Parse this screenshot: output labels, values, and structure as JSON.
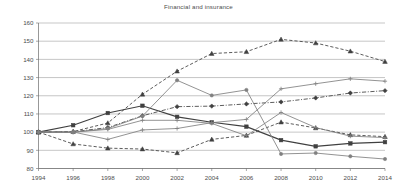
{
  "chart": {
    "title": "Financial and insurance",
    "domain_note": "line chart"
  },
  "axes": {
    "y_ticks": [
      "80",
      "90",
      "100",
      "110",
      "120",
      "130",
      "140",
      "150",
      "160"
    ],
    "x_ticks": [
      "1994",
      "1996",
      "1998",
      "2000",
      "2002",
      "2004",
      "2006",
      "2008",
      "2010",
      "2012",
      "2014"
    ]
  },
  "chart_data": {
    "type": "line",
    "title": "Financial and insurance",
    "xlabel": "",
    "ylabel": "",
    "x": [
      1994,
      1996,
      1998,
      2000,
      2002,
      2004,
      2006,
      2008,
      2010,
      2012,
      2014
    ],
    "xlim": [
      1994,
      2014
    ],
    "ylim": [
      80,
      160
    ],
    "y_ticks": [
      80,
      90,
      100,
      110,
      120,
      130,
      140,
      150,
      160
    ],
    "grid": true,
    "legend": "none",
    "series": [
      {
        "name": "series-1-dashed-triangle",
        "style": "dashed",
        "marker": "triangle",
        "color": "#404040",
        "values": [
          100,
          93.5,
          91.2,
          90.7,
          88.6,
          96.0,
          98.2,
          105.5,
          102.3,
          98.5,
          97.5
        ]
      },
      {
        "name": "series-2-dashed-triangle-high",
        "style": "dashed",
        "marker": "triangle",
        "color": "#404040",
        "values": [
          100,
          100.3,
          105.0,
          120.8,
          133.5,
          143.2,
          144.2,
          151.0,
          149.0,
          144.5,
          138.8
        ]
      },
      {
        "name": "series-3-solid-square",
        "style": "solid",
        "marker": "square",
        "color": "#404040",
        "values": [
          100,
          103.8,
          110.5,
          114.5,
          108.4,
          105.4,
          103.0,
          95.6,
          92.2,
          93.8,
          94.5
        ]
      },
      {
        "name": "series-4-dashdot-diamond",
        "style": "dashdot",
        "marker": "diamond",
        "color": "#404040",
        "values": [
          100,
          100.2,
          102.5,
          109.0,
          114.0,
          114.3,
          115.5,
          116.6,
          118.8,
          121.5,
          122.8
        ]
      },
      {
        "name": "series-5-solid-plus",
        "style": "solid",
        "marker": "plus",
        "color": "#808080",
        "values": [
          100,
          100.1,
          96.0,
          101.2,
          102.0,
          105.2,
          107.0,
          123.8,
          126.6,
          129.3,
          128.0
        ]
      },
      {
        "name": "series-6-solid-circle",
        "style": "solid",
        "marker": "circle",
        "color": "#808080",
        "values": [
          100,
          99.9,
          102.0,
          108.8,
          128.5,
          120.2,
          123.2,
          88.0,
          88.5,
          86.7,
          85.2
        ]
      },
      {
        "name": "series-7-solid-plus-low",
        "style": "solid",
        "marker": "plus",
        "color": "#808080",
        "values": [
          100,
          100.0,
          101.5,
          106.5,
          106.5,
          104.8,
          98.0,
          110.8,
          102.5,
          97.8,
          97.0
        ]
      }
    ]
  }
}
